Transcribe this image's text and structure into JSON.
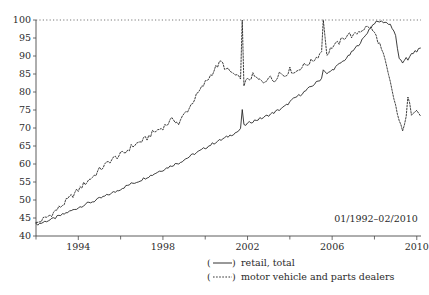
{
  "chart_data": {
    "type": "line",
    "title": "",
    "subtitle": "",
    "xlabel": "",
    "ylabel": "",
    "annotation": "01/1992–02/2010",
    "xlim": [
      1992.0,
      2010.2
    ],
    "ylim": [
      40,
      100
    ],
    "grid": false,
    "legend_position": "below-right",
    "reference_lines": [
      {
        "axis": "y",
        "value": 100,
        "style": "dotted"
      }
    ],
    "ytick_labels": [
      "40",
      "45",
      "50",
      "55",
      "60",
      "65",
      "70",
      "75",
      "80",
      "85",
      "90",
      "95",
      "100"
    ],
    "ytick_values": [
      40,
      45,
      50,
      55,
      60,
      65,
      70,
      75,
      80,
      85,
      90,
      95,
      100
    ],
    "xtick_labels": [
      "1994",
      "1998",
      "2002",
      "2006",
      "2010"
    ],
    "xtick_values": [
      1994,
      1998,
      2002,
      2006,
      2010
    ],
    "xtick_minor_values": [
      1992,
      1996,
      2000,
      2004,
      2008
    ],
    "series": [
      {
        "name": "retail, total",
        "style": "solid",
        "legend_marker": "(——)",
        "x": [
          1992.0,
          1992.25,
          1992.5,
          1992.75,
          1993.0,
          1993.25,
          1993.5,
          1993.75,
          1994.0,
          1994.25,
          1994.5,
          1994.75,
          1995.0,
          1995.25,
          1995.5,
          1995.75,
          1996.0,
          1996.25,
          1996.5,
          1996.75,
          1997.0,
          1997.25,
          1997.5,
          1997.75,
          1998.0,
          1998.25,
          1998.5,
          1998.75,
          1999.0,
          1999.25,
          1999.5,
          1999.75,
          2000.0,
          2000.25,
          2000.5,
          2000.75,
          2001.0,
          2001.25,
          2001.5,
          2001.67,
          2001.75,
          2001.83,
          2002.0,
          2002.25,
          2002.5,
          2002.75,
          2003.0,
          2003.25,
          2003.5,
          2003.75,
          2004.0,
          2004.25,
          2004.5,
          2004.75,
          2005.0,
          2005.25,
          2005.5,
          2005.58,
          2005.75,
          2006.0,
          2006.25,
          2006.5,
          2006.75,
          2007.0,
          2007.25,
          2007.5,
          2007.75,
          2008.0,
          2008.25,
          2008.5,
          2008.75,
          2009.0,
          2009.17,
          2009.33,
          2009.5,
          2009.58,
          2009.75,
          2010.0,
          2010.17
        ],
        "y": [
          43.2,
          43.6,
          44.2,
          44.6,
          45.3,
          45.9,
          46.6,
          47.2,
          47.9,
          48.6,
          49.2,
          49.7,
          50.4,
          51.0,
          51.7,
          52.3,
          53.1,
          53.8,
          54.5,
          55.0,
          55.7,
          56.4,
          57.0,
          57.8,
          58.4,
          59.1,
          59.8,
          60.3,
          61.2,
          62.0,
          62.9,
          63.6,
          64.5,
          65.3,
          66.1,
          66.7,
          67.4,
          68.2,
          68.9,
          69.6,
          75.2,
          70.6,
          71.2,
          71.9,
          72.4,
          72.9,
          73.6,
          74.3,
          75.1,
          75.9,
          77.2,
          78.4,
          79.3,
          80.3,
          81.5,
          82.6,
          83.8,
          86.4,
          84.9,
          86.1,
          87.3,
          88.5,
          89.8,
          91.5,
          93.2,
          95.0,
          97.4,
          99.2,
          99.6,
          99.4,
          98.8,
          95.6,
          89.0,
          88.1,
          89.8,
          88.6,
          90.6,
          91.4,
          92.2
        ]
      },
      {
        "name": "motor vehicle and parts dealers",
        "style": "dashed",
        "legend_marker": "(-----)",
        "x": [
          1992.0,
          1992.25,
          1992.5,
          1992.75,
          1993.0,
          1993.25,
          1993.5,
          1993.75,
          1994.0,
          1994.25,
          1994.5,
          1994.75,
          1995.0,
          1995.25,
          1995.5,
          1995.75,
          1996.0,
          1996.25,
          1996.5,
          1996.75,
          1997.0,
          1997.25,
          1997.5,
          1997.75,
          1998.0,
          1998.25,
          1998.5,
          1998.75,
          1999.0,
          1999.25,
          1999.5,
          1999.75,
          2000.0,
          2000.25,
          2000.5,
          2000.75,
          2001.0,
          2001.25,
          2001.5,
          2001.67,
          2001.75,
          2001.83,
          2002.0,
          2002.25,
          2002.5,
          2002.75,
          2003.0,
          2003.25,
          2003.5,
          2003.75,
          2004.0,
          2004.25,
          2004.5,
          2004.75,
          2005.0,
          2005.25,
          2005.5,
          2005.58,
          2005.75,
          2006.0,
          2006.25,
          2006.5,
          2006.75,
          2007.0,
          2007.25,
          2007.5,
          2007.75,
          2008.0,
          2008.25,
          2008.5,
          2008.75,
          2009.0,
          2009.17,
          2009.33,
          2009.5,
          2009.58,
          2009.75,
          2010.0,
          2010.17
        ],
        "y": [
          43.4,
          44.3,
          45.2,
          46.1,
          47.4,
          48.6,
          50.1,
          51.4,
          52.8,
          54.3,
          55.6,
          56.8,
          58.4,
          59.6,
          60.9,
          61.8,
          62.6,
          63.4,
          64.8,
          65.6,
          66.4,
          67.2,
          68.6,
          69.4,
          70.2,
          71.4,
          72.6,
          71.1,
          73.8,
          75.6,
          78.2,
          80.4,
          82.6,
          84.6,
          86.8,
          88.4,
          86.2,
          85.4,
          84.1,
          83.6,
          100.0,
          82.4,
          83.2,
          84.6,
          83.4,
          82.8,
          84.2,
          83.1,
          85.4,
          84.6,
          86.2,
          85.4,
          86.8,
          87.6,
          88.4,
          89.6,
          91.2,
          100.0,
          90.4,
          92.6,
          93.4,
          94.6,
          96.2,
          95.4,
          96.8,
          97.6,
          98.2,
          96.4,
          93.2,
          88.6,
          82.4,
          76.2,
          71.4,
          69.8,
          72.6,
          78.4,
          74.2,
          75.6,
          73.4
        ]
      }
    ]
  },
  "legend": {
    "entries": [
      {
        "marker": "(——)",
        "label": "retail, total"
      },
      {
        "marker": "(-----)",
        "label": "motor vehicle and parts dealers"
      }
    ]
  },
  "annotation": {
    "date_range": "01/1992–02/2010"
  }
}
